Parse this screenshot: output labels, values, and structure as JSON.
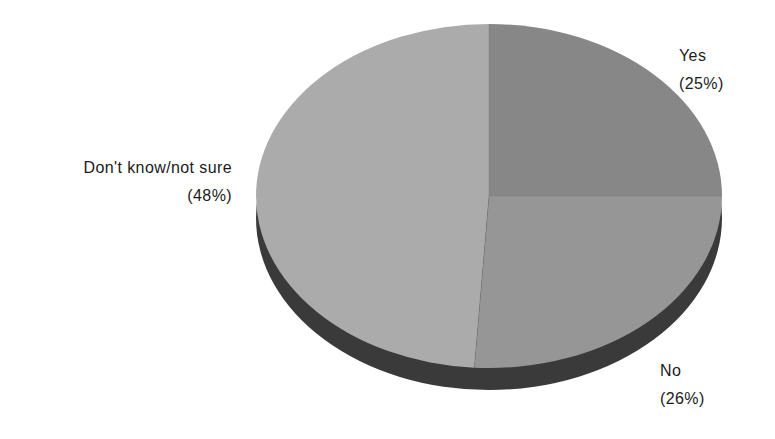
{
  "chart_data": {
    "type": "pie",
    "title": "",
    "subtitle": "",
    "xlabel": "",
    "ylabel": "",
    "legend_position": "none",
    "grid": false,
    "three_d": true,
    "categories": [
      "Yes",
      "No",
      "Don't know/not sure"
    ],
    "values": [
      25,
      26,
      48
    ],
    "value_unit": "%",
    "slices": [
      {
        "label": "Yes",
        "value": 25,
        "pct_text": "(25%)",
        "color": "#878787",
        "start_angle_deg": 0,
        "end_angle_deg": 90
      },
      {
        "label": "No",
        "value": 26,
        "pct_text": "(26%)",
        "color": "#969696",
        "start_angle_deg": 90,
        "end_angle_deg": 183.6
      },
      {
        "label": "Don't know/not sure",
        "value": 48,
        "pct_text": "(48%)",
        "color": "#ababab",
        "start_angle_deg": 183.6,
        "end_angle_deg": 360
      }
    ],
    "annotations": [
      {
        "text": "Yes",
        "pct_text": "(25%)"
      },
      {
        "text": "No",
        "pct_text": "(26%)"
      },
      {
        "text": "Don't know/not sure",
        "pct_text": "(48%)"
      }
    ]
  },
  "labels": {
    "yes": {
      "name": "Yes",
      "pct": "(25%)"
    },
    "no": {
      "name": "No",
      "pct": "(26%)"
    },
    "dont_know": {
      "name": "Don't know/not sure",
      "pct": "(48%)"
    }
  },
  "colors": {
    "background": "#ffffff",
    "slice_yes": "#878787",
    "slice_no": "#969696",
    "slice_dont_know": "#ababab",
    "rim_dark": "#3a3a3a",
    "rim_dark_left": "#434343",
    "text": "#1b1b1b"
  }
}
